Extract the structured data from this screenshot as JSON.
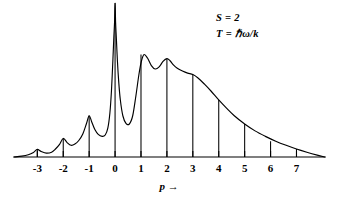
{
  "figure": {
    "background_color": "#ffffff",
    "ink_color": "#000000"
  },
  "annotations": {
    "line1": "S = 2",
    "line2": "T = ℏω/k"
  },
  "axis": {
    "xlabel": "p →",
    "xlabel_symbol": "p",
    "xlabel_arrow": "→"
  },
  "chart_data": {
    "type": "line",
    "title": "",
    "subtitle": "",
    "xlabel": "p →",
    "ylabel": "",
    "grid": false,
    "legend": "none",
    "annotations": [
      "S = 2",
      "T = ℏω/k"
    ],
    "xlim": [
      -3.9,
      8.1
    ],
    "ylim": [
      0,
      1.12
    ],
    "xticks": [
      -3,
      -2,
      -1,
      0,
      1,
      2,
      3,
      4,
      5,
      6,
      7
    ],
    "xticklabels": [
      "-3",
      "-2",
      "-1",
      "0",
      "1",
      "2",
      "3",
      "4",
      "5",
      "6",
      "7"
    ],
    "yticks": [],
    "yticklabels": [],
    "axis_style": "x-axis-only-baseline-with-upward-ticks",
    "series": [
      {
        "name": "envelope",
        "type": "line",
        "comment": "Continuous phonon sideband envelope; sharp zero-phonon line at p = 0 is clipped by the top of the frame.",
        "x": [
          -3.9,
          -3.6,
          -3.35,
          -3.15,
          -3.0,
          -2.85,
          -2.65,
          -2.45,
          -2.3,
          -2.15,
          -2.0,
          -1.85,
          -1.7,
          -1.55,
          -1.4,
          -1.25,
          -1.1,
          -1.0,
          -0.9,
          -0.78,
          -0.65,
          -0.5,
          -0.38,
          -0.28,
          -0.2,
          -0.14,
          -0.09,
          -0.05,
          -0.02,
          0.0,
          0.02,
          0.05,
          0.09,
          0.14,
          0.2,
          0.3,
          0.42,
          0.55,
          0.68,
          0.8,
          0.92,
          1.02,
          1.12,
          1.25,
          1.4,
          1.55,
          1.7,
          1.85,
          2.0,
          2.12,
          2.25,
          2.4,
          2.6,
          2.8,
          3.0,
          3.2,
          3.45,
          3.7,
          4.0,
          4.3,
          4.6,
          5.0,
          5.4,
          5.8,
          6.2,
          6.6,
          7.0,
          7.4,
          7.8,
          8.1
        ],
        "y": [
          0.0,
          0.006,
          0.016,
          0.033,
          0.055,
          0.04,
          0.028,
          0.035,
          0.058,
          0.09,
          0.135,
          0.105,
          0.085,
          0.094,
          0.12,
          0.165,
          0.245,
          0.3,
          0.255,
          0.2,
          0.165,
          0.15,
          0.16,
          0.21,
          0.32,
          0.48,
          0.68,
          0.86,
          0.98,
          1.12,
          0.98,
          0.86,
          0.7,
          0.55,
          0.42,
          0.3,
          0.245,
          0.24,
          0.3,
          0.44,
          0.6,
          0.7,
          0.745,
          0.72,
          0.665,
          0.64,
          0.655,
          0.695,
          0.715,
          0.7,
          0.67,
          0.645,
          0.625,
          0.61,
          0.6,
          0.575,
          0.53,
          0.48,
          0.415,
          0.355,
          0.3,
          0.24,
          0.19,
          0.15,
          0.115,
          0.085,
          0.058,
          0.035,
          0.014,
          0.0
        ]
      },
      {
        "name": "phonon-sticks",
        "type": "stem",
        "comment": "Vertical stick lines drawn upward from the baseline at each integer p.",
        "x": [
          -3,
          -2,
          -1,
          0,
          1,
          2,
          3,
          4,
          5,
          6,
          7
        ],
        "y": [
          0.055,
          0.135,
          0.3,
          1.12,
          0.745,
          0.715,
          0.6,
          0.415,
          0.24,
          0.115,
          0.058
        ]
      }
    ]
  }
}
